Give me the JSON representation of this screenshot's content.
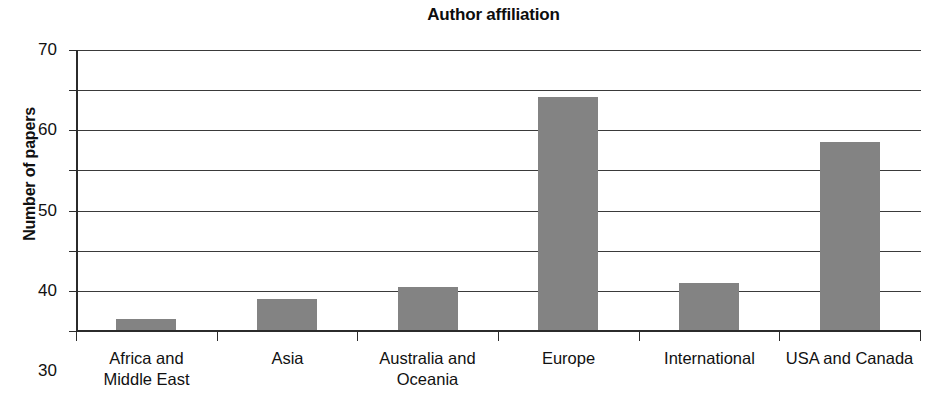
{
  "chart_data": {
    "type": "bar",
    "title": "Author affiliation",
    "xlabel": "",
    "ylabel": "Number of papers",
    "categories": [
      "Africa and\nMiddle East",
      "Asia",
      "Australia and\nOceania",
      "Europe",
      "International",
      "USA and Canada"
    ],
    "values": [
      2.7,
      7.7,
      10.6,
      58.1,
      11.8,
      46.8
    ],
    "ylim": [
      0,
      70
    ],
    "ytick_labels": [
      "70",
      "60",
      "50",
      "40",
      "30",
      "20",
      "10",
      "0"
    ],
    "ytick_values": [
      70,
      60,
      50,
      40,
      30,
      20,
      10,
      0
    ],
    "grid": "horizontal",
    "legend": "none",
    "bar_color": "#838383",
    "axis_color": "#2b2b2b",
    "background": "#ffffff"
  }
}
